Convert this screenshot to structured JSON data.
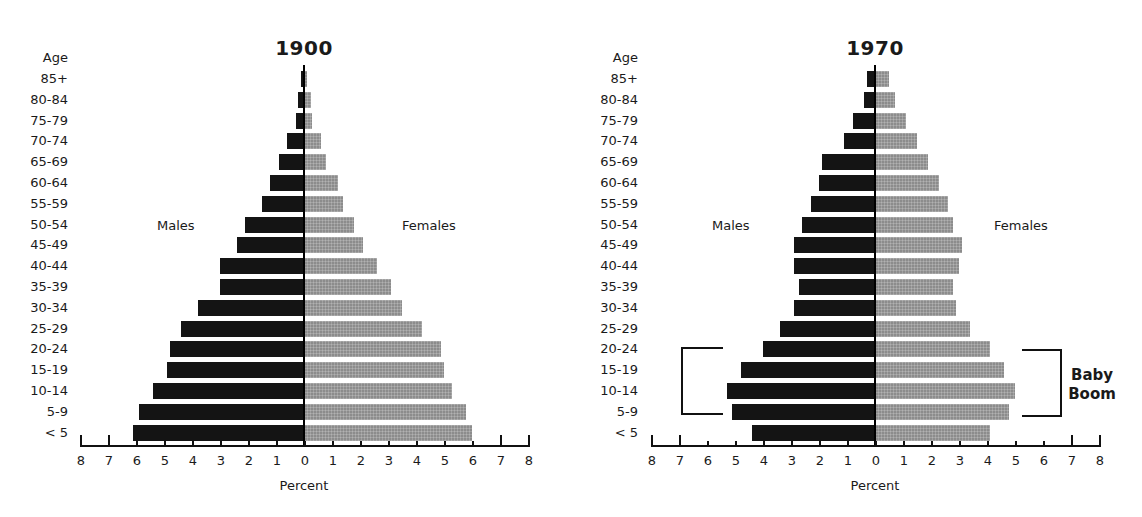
{
  "chart_data": [
    {
      "type": "bar",
      "subtype": "population-pyramid",
      "title": "1900",
      "ylabel": "Age",
      "xlabel": "Percent",
      "categories": [
        "85+",
        "80-84",
        "75-79",
        "70-74",
        "65-69",
        "60-64",
        "55-59",
        "50-54",
        "45-49",
        "40-44",
        "35-39",
        "30-34",
        "25-29",
        "20-24",
        "15-19",
        "10-14",
        "5-9",
        "< 5"
      ],
      "series": [
        {
          "name": "Males",
          "color": "#141414",
          "values": [
            0.1,
            0.2,
            0.3,
            0.6,
            0.9,
            1.2,
            1.5,
            2.1,
            2.4,
            3.0,
            3.0,
            3.8,
            4.4,
            4.8,
            4.9,
            5.4,
            5.9,
            6.1
          ]
        },
        {
          "name": "Females",
          "color": "#8c8c8c",
          "values": [
            0.1,
            0.25,
            0.3,
            0.6,
            0.8,
            1.2,
            1.4,
            1.8,
            2.1,
            2.6,
            3.1,
            3.5,
            4.2,
            4.9,
            5.0,
            5.3,
            5.8,
            6.0
          ]
        }
      ],
      "xlim": [
        -8,
        8
      ],
      "x_ticks": [
        "8",
        "7",
        "6",
        "5",
        "4",
        "3",
        "2",
        "1",
        "0",
        "1",
        "2",
        "3",
        "4",
        "5",
        "6",
        "7",
        "8"
      ],
      "grid": false,
      "legend": "inline labels (Males left, Females right)"
    },
    {
      "type": "bar",
      "subtype": "population-pyramid",
      "title": "1970",
      "ylabel": "Age",
      "xlabel": "Percent",
      "categories": [
        "85+",
        "80-84",
        "75-79",
        "70-74",
        "65-69",
        "60-64",
        "55-59",
        "50-54",
        "45-49",
        "40-44",
        "35-39",
        "30-34",
        "25-29",
        "20-24",
        "15-19",
        "10-14",
        "5-9",
        "< 5"
      ],
      "series": [
        {
          "name": "Males",
          "color": "#141414",
          "values": [
            0.3,
            0.4,
            0.8,
            1.1,
            1.9,
            2.0,
            2.3,
            2.6,
            2.9,
            2.9,
            2.7,
            2.9,
            3.4,
            4.0,
            4.8,
            5.3,
            5.1,
            4.4
          ]
        },
        {
          "name": "Females",
          "color": "#8c8c8c",
          "values": [
            0.5,
            0.7,
            1.1,
            1.5,
            1.9,
            2.3,
            2.6,
            2.8,
            3.1,
            3.0,
            2.8,
            2.9,
            3.4,
            4.1,
            4.6,
            5.0,
            4.8,
            4.1
          ]
        }
      ],
      "xlim": [
        -8,
        8
      ],
      "x_ticks": [
        "8",
        "7",
        "6",
        "5",
        "4",
        "3",
        "2",
        "1",
        "0",
        "1",
        "2",
        "3",
        "4",
        "5",
        "6",
        "7",
        "8"
      ],
      "grid": false,
      "legend": "inline labels (Males left, Females right)",
      "annotations": [
        {
          "text": "Baby Boom",
          "span": [
            "5-9",
            "20-24"
          ]
        }
      ]
    }
  ],
  "charts": [
    {
      "title": "1900",
      "age_header": "Age",
      "males_label": "Males",
      "females_label": "Females",
      "xlabel": "Percent"
    },
    {
      "title": "1970",
      "age_header": "Age",
      "males_label": "Males",
      "females_label": "Females",
      "xlabel": "Percent",
      "annotation_line1": "Baby",
      "annotation_line2": "Boom"
    }
  ]
}
